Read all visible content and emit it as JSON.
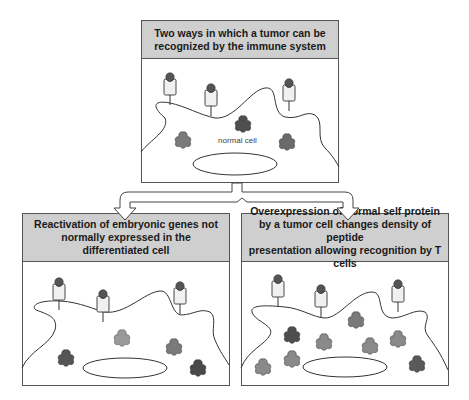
{
  "diagram": {
    "top_panel": {
      "title": "Two ways in which a tumor can be\nrecognized by the immune system",
      "cell_label": "normal cell"
    },
    "left_panel": {
      "title": "Reactivation of embryonic genes not\nnormally expressed in the differentiated cell"
    },
    "right_panel": {
      "title": "Overexpression of normal self protein\nby a tumor cell changes density of peptide\npresentation allowing recognition by T cells"
    },
    "colors": {
      "header_fill": "#cfcfcf",
      "border": "#555555",
      "mhc_fill": "#f0f0f0",
      "peptide_dark": "#555555",
      "protein_dark": "#4e4e4e",
      "protein_mid": "#7a7a7a",
      "protein_light": "#9a9a9a"
    }
  }
}
